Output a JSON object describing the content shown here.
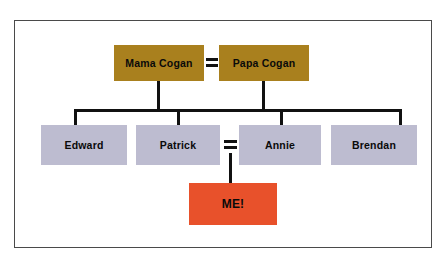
{
  "diagram": {
    "frame": {
      "border_color": "#4a4a4a",
      "background": "#ffffff"
    },
    "colors": {
      "parents": "#a9801e",
      "children": "#bdbcd0",
      "self": "#e8512b",
      "connector": "#111111",
      "text": "#0a0a0a"
    },
    "generations": [
      {
        "name": "parents",
        "people": [
          {
            "id": "mama-cogan",
            "label": "Mama Cogan",
            "color": "#a9801e"
          },
          {
            "id": "papa-cogan",
            "label": "Papa Cogan",
            "color": "#a9801e"
          }
        ],
        "union_symbol": "="
      },
      {
        "name": "children",
        "people": [
          {
            "id": "edward",
            "label": "Edward",
            "color": "#bdbcd0"
          },
          {
            "id": "patrick",
            "label": "Patrick",
            "color": "#bdbcd0"
          },
          {
            "id": "annie",
            "label": "Annie",
            "color": "#bdbcd0"
          },
          {
            "id": "brendan",
            "label": "Brendan",
            "color": "#bdbcd0"
          }
        ],
        "union_symbol": "="
      },
      {
        "name": "self",
        "people": [
          {
            "id": "me",
            "label": "ME!",
            "color": "#e8512b"
          }
        ]
      }
    ]
  }
}
